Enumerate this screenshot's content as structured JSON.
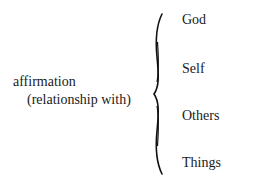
{
  "left_label": {
    "line1": "affirmation",
    "line2": "(relationship with)"
  },
  "items": [
    {
      "label": "God"
    },
    {
      "label": "Self"
    },
    {
      "label": "Others"
    },
    {
      "label": "Things"
    }
  ]
}
